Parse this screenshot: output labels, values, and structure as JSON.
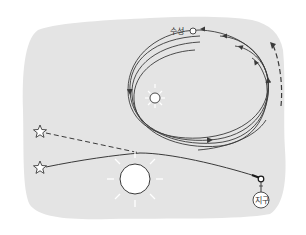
{
  "diagram": {
    "background_color": "#e4e4e4",
    "line_color": "#3a3a3a",
    "labels": {
      "mercury": "수성",
      "earth": "지구"
    },
    "elements": {
      "small_sun": "sun-near-orbit",
      "large_sun": "sun-lensing",
      "stars": [
        "apparent-star-position",
        "actual-star-position"
      ],
      "orbits_count": 4,
      "precession_arrow": "dashed-arrow-upward"
    }
  }
}
